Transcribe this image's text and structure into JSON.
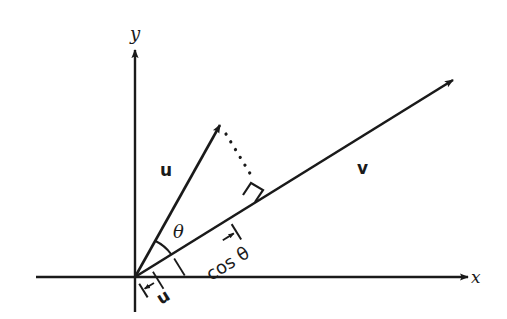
{
  "diagram": {
    "axes": {
      "x_label": "x",
      "y_label": "y"
    },
    "vectors": {
      "u_label": "u",
      "v_label": "v"
    },
    "angle_label": "θ",
    "projection": {
      "magnitude_label": "u",
      "cos_label": "cos θ"
    },
    "colors": {
      "ink": "#1a1a1a",
      "background": "#ffffff"
    }
  }
}
